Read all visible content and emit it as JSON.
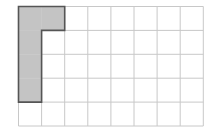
{
  "grid": {
    "columns": 8,
    "rows": 5,
    "left": 18.5,
    "top": 6.5,
    "cell_width": 23.1,
    "cell_height": 23.9,
    "line_color": "#c8c8c8",
    "background": "#ffffff"
  },
  "shape": {
    "name": "L-shape",
    "fill": "#c4c4c4",
    "stroke": "#555555",
    "cells": [
      [
        0,
        0
      ],
      [
        1,
        0
      ],
      [
        0,
        1
      ],
      [
        0,
        2
      ],
      [
        0,
        3
      ]
    ],
    "outline": [
      [
        0,
        0
      ],
      [
        2,
        0
      ],
      [
        2,
        1
      ],
      [
        1,
        1
      ],
      [
        1,
        4
      ],
      [
        0,
        4
      ]
    ]
  }
}
